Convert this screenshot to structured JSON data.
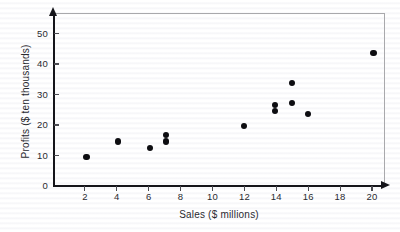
{
  "chart_data": {
    "type": "scatter",
    "title": "",
    "xlabel": "Sales ($ millions)",
    "ylabel": "Profits ($ ten thousands)",
    "xlim": [
      0,
      20.8
    ],
    "ylim": [
      0,
      56
    ],
    "grid": false,
    "legend": null,
    "x_ticks": [
      2,
      4,
      6,
      8,
      10,
      12,
      14,
      16,
      18,
      20
    ],
    "y_ticks": [
      0,
      10,
      20,
      30,
      40,
      50
    ],
    "x_tick_labels": [
      "2",
      "4",
      "6",
      "8",
      "10",
      "12",
      "14",
      "16",
      "18",
      "20"
    ],
    "y_tick_labels": [
      "0",
      "10",
      "20",
      "30",
      "40",
      "50"
    ],
    "marker": "filled-circle",
    "marker_color": "#0d0d11",
    "points": [
      {
        "x": 2.1,
        "y": 9.5
      },
      {
        "x": 4.1,
        "y": 14.6
      },
      {
        "x": 6.1,
        "y": 12.5
      },
      {
        "x": 7.1,
        "y": 16.8
      },
      {
        "x": 7.1,
        "y": 14.6
      },
      {
        "x": 12.0,
        "y": 19.6
      },
      {
        "x": 13.9,
        "y": 26.6
      },
      {
        "x": 13.9,
        "y": 24.6
      },
      {
        "x": 15.0,
        "y": 33.8
      },
      {
        "x": 15.0,
        "y": 27.1
      },
      {
        "x": 16.0,
        "y": 23.7
      },
      {
        "x": 20.1,
        "y": 43.6
      }
    ]
  },
  "colors": {
    "axis": "#15151a",
    "frame": "#a9a9ac",
    "tick": "#4a4a50",
    "text": "#2a2a30",
    "marker": "#0d0d11",
    "background": "#ffffff"
  }
}
